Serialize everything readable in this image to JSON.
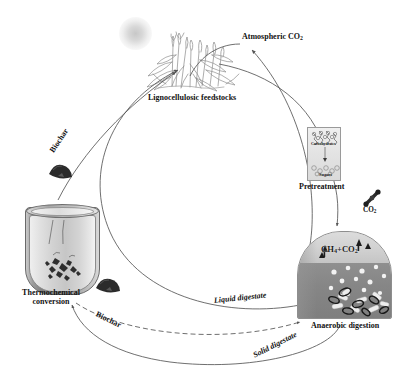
{
  "figure": {
    "background_color": "#ffffff",
    "line_color": "#555555"
  },
  "nodes": {
    "atmospheric_co2": {
      "label": "Atmospheric CO",
      "subscript": "2"
    },
    "lignocellulosic_feedstocks": {
      "label": "Lignocellulosic feedstocks"
    },
    "pretreatment": {
      "label": "Pretreatment"
    },
    "anaerobic_digestion": {
      "label": "Anaerobic digestion"
    },
    "thermochemical_conversion": {
      "label": "Thermochemical conversion"
    },
    "co2_release": {
      "label": "CO",
      "subscript": "2"
    }
  },
  "flask": {
    "top_label": "Carbohydrates",
    "bottom_label": "Sugars"
  },
  "digester": {
    "biogas_label": "CH",
    "biogas_sub1": "4",
    "biogas_mid": "+CO",
    "biogas_sub2": "2"
  },
  "streams": {
    "biochar_upper": {
      "label": "Biochar"
    },
    "biochar_lower": {
      "label": "Biochar"
    },
    "liquid_digestate": {
      "label": "Liquid digestate"
    },
    "solid_digestate": {
      "label": "Solid digestate"
    }
  },
  "icons": {
    "sun": "sun-icon",
    "plants": "lignocellulosic-plants-icon",
    "biochar_pile_upper": "biochar-pile-icon",
    "biochar_pile_lower": "biochar-pile-icon",
    "co2_molecule": "co2-molecule-icon",
    "reactor": "thermochemical-reactor-icon",
    "digester": "anaerobic-digester-icon",
    "flask": "pretreatment-flask-icon",
    "biogas_arrows": "gas-release-arrow-icon"
  },
  "colors": {
    "outline": "#555555",
    "text": "#111111",
    "digester_liquid": "#868686",
    "digester_headspace": "#cfcfcf",
    "reactor_shell": "#8e8e8e",
    "biochar": "#303030"
  }
}
